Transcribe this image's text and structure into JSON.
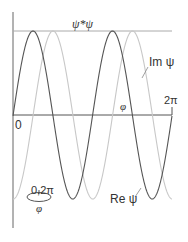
{
  "diagram": {
    "title_label": "ψ*ψ",
    "im_label": "Im ψ",
    "re_label": "Re ψ",
    "phi_label": "φ",
    "zero_label": "0",
    "two_pi_label": "2π",
    "loop_label": "0,2π",
    "loop_phi_label": "φ",
    "colors": {
      "re_curve": "#555555",
      "im_curve": "#c8c8c8",
      "axis": "#555555",
      "envelope": "#999999"
    }
  }
}
